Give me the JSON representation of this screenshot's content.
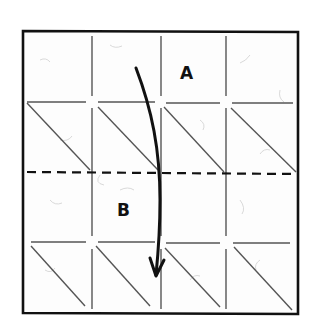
{
  "diagram": {
    "type": "origami-fold-step",
    "labels": {
      "a": "A",
      "b": "B"
    },
    "grid": {
      "rows": 4,
      "cols": 4
    },
    "fold": {
      "line_style": "dashed",
      "direction": "top-half-down",
      "from": "A",
      "to": "B"
    },
    "colors": {
      "outline": "#111111",
      "crease": "#555555",
      "paper": "#ffffff"
    }
  }
}
